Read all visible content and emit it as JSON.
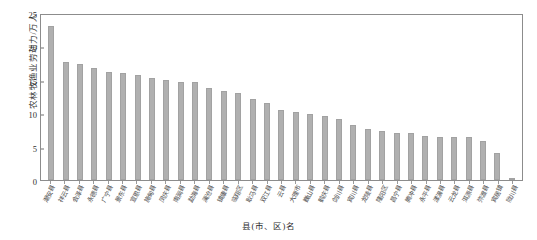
{
  "top_caption_fragment": "",
  "chart_data": {
    "type": "bar",
    "title": "",
    "xlabel": "县(市、区)名",
    "ylabel": "农林牧渔业劳动力/万人",
    "ylim": [
      0,
      25
    ],
    "yticks": [
      0,
      5,
      10,
      15,
      20,
      25
    ],
    "ytick_labels": [
      "0",
      "5",
      "10",
      "15",
      "20",
      "25"
    ],
    "grid": false,
    "legend": null,
    "bar_color": "#b0b0b0",
    "categories": [
      "潮安县",
      "祥云县",
      "会泽县",
      "永德县",
      "广宁县",
      "景东县",
      "宣恩县",
      "施甸县",
      "凤庆县",
      "南涧县",
      "勐海县",
      "澜沧县",
      "镇康县",
      "临翔区",
      "耿马县",
      "双江县",
      "云县",
      "大理市",
      "巍山县",
      "鹤庆县",
      "剑川县",
      "宾川县",
      "龙陵县",
      "隆阳区",
      "昌宁县",
      "腾冲县",
      "永平县",
      "漾濞县",
      "云龙县",
      "洱源县",
      "弥渡县",
      "宾居镇",
      "陇川县"
    ],
    "values": [
      23.1,
      17.7,
      17.3,
      16.7,
      16.2,
      16.0,
      15.7,
      15.3,
      15.0,
      14.7,
      14.6,
      13.8,
      13.3,
      13.1,
      12.1,
      11.5,
      10.5,
      10.2,
      9.9,
      9.6,
      9.2,
      8.3,
      7.7,
      7.4,
      7.1,
      7.1,
      6.6,
      6.5,
      6.5,
      6.4,
      5.8,
      4.1,
      0.3
    ]
  }
}
